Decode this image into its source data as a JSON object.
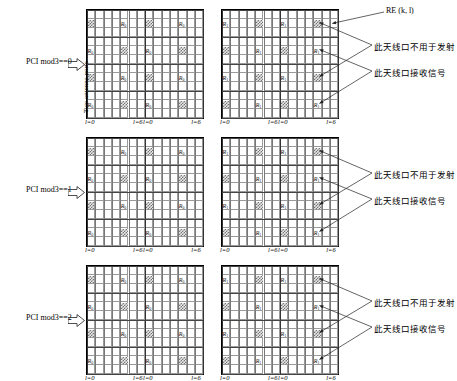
{
  "figure": {
    "vertical_axis_label": "Two antenna ports",
    "re_annotation": "RE (k, l)",
    "re_k": "k",
    "re_l": "l",
    "tick_l0": "l=0",
    "tick_l6": "l=6",
    "ann_not_transmit": "此天线口不用于发射",
    "ann_receive": "此天线口接收信号",
    "grid": {
      "columns": 14,
      "rows": 12,
      "subblock_columns": 7
    },
    "colors": {
      "grid_minor": "#9a9a9a",
      "grid_major": "#444444",
      "hatch": "#777777",
      "border": "#000000",
      "text": "#000000"
    }
  },
  "panels": [
    {
      "id": "panel-0",
      "pci_label": "PCI mod3==0",
      "blocks": [
        {
          "id": "port-0",
          "symbol": "R",
          "subscript": "0",
          "r_cells": [
            [
              1,
              4
            ],
            [
              1,
              11
            ],
            [
              4,
              0
            ],
            [
              4,
              7
            ],
            [
              7,
              4
            ],
            [
              7,
              11
            ],
            [
              10,
              0
            ],
            [
              10,
              7
            ]
          ],
          "hatch_cells": [
            [
              1,
              0
            ],
            [
              1,
              7
            ],
            [
              4,
              4
            ],
            [
              4,
              11
            ],
            [
              7,
              0
            ],
            [
              7,
              7
            ],
            [
              10,
              4
            ],
            [
              10,
              11
            ]
          ]
        },
        {
          "id": "port-1",
          "symbol": "R",
          "subscript": "1",
          "r_cells": [
            [
              1,
              0
            ],
            [
              1,
              7
            ],
            [
              4,
              4
            ],
            [
              4,
              11
            ],
            [
              7,
              0
            ],
            [
              7,
              7
            ],
            [
              10,
              4
            ],
            [
              10,
              11
            ]
          ],
          "hatch_cells": [
            [
              1,
              4
            ],
            [
              1,
              11
            ],
            [
              4,
              0
            ],
            [
              4,
              7
            ],
            [
              7,
              4
            ],
            [
              7,
              11
            ],
            [
              10,
              0
            ],
            [
              10,
              7
            ]
          ]
        }
      ]
    },
    {
      "id": "panel-1",
      "pci_label": "PCI mod3==1",
      "blocks": [
        {
          "id": "port-0",
          "symbol": "R",
          "subscript": "0",
          "r_cells": [
            [
              1,
              4
            ],
            [
              1,
              11
            ],
            [
              4,
              0
            ],
            [
              4,
              7
            ],
            [
              7,
              4
            ],
            [
              7,
              11
            ],
            [
              10,
              0
            ],
            [
              10,
              7
            ]
          ],
          "hatch_cells": [
            [
              1,
              0
            ],
            [
              1,
              7
            ],
            [
              4,
              4
            ],
            [
              4,
              11
            ],
            [
              7,
              0
            ],
            [
              7,
              7
            ],
            [
              10,
              4
            ],
            [
              10,
              11
            ]
          ]
        },
        {
          "id": "port-1",
          "symbol": "R",
          "subscript": "1",
          "r_cells": [
            [
              1,
              0
            ],
            [
              1,
              7
            ],
            [
              4,
              4
            ],
            [
              4,
              11
            ],
            [
              7,
              0
            ],
            [
              7,
              7
            ],
            [
              10,
              4
            ],
            [
              10,
              11
            ]
          ],
          "hatch_cells": [
            [
              1,
              4
            ],
            [
              1,
              11
            ],
            [
              4,
              0
            ],
            [
              4,
              7
            ],
            [
              7,
              4
            ],
            [
              7,
              11
            ],
            [
              10,
              0
            ],
            [
              10,
              7
            ]
          ]
        }
      ]
    },
    {
      "id": "panel-2",
      "pci_label": "PCI mod3==2",
      "blocks": [
        {
          "id": "port-0",
          "symbol": "R",
          "subscript": "0",
          "r_cells": [
            [
              1,
              4
            ],
            [
              1,
              11
            ],
            [
              4,
              0
            ],
            [
              4,
              7
            ],
            [
              7,
              4
            ],
            [
              7,
              11
            ],
            [
              10,
              0
            ],
            [
              10,
              7
            ]
          ],
          "hatch_cells": [
            [
              1,
              0
            ],
            [
              1,
              7
            ],
            [
              4,
              4
            ],
            [
              4,
              11
            ],
            [
              7,
              0
            ],
            [
              7,
              7
            ],
            [
              10,
              4
            ],
            [
              10,
              11
            ]
          ]
        },
        {
          "id": "port-1",
          "symbol": "R",
          "subscript": "1",
          "r_cells": [
            [
              1,
              0
            ],
            [
              1,
              7
            ],
            [
              4,
              4
            ],
            [
              4,
              11
            ],
            [
              7,
              0
            ],
            [
              7,
              7
            ],
            [
              10,
              4
            ],
            [
              10,
              11
            ]
          ],
          "hatch_cells": [
            [
              1,
              4
            ],
            [
              1,
              11
            ],
            [
              4,
              0
            ],
            [
              4,
              7
            ],
            [
              7,
              4
            ],
            [
              7,
              11
            ],
            [
              10,
              0
            ],
            [
              10,
              7
            ]
          ]
        }
      ]
    }
  ]
}
